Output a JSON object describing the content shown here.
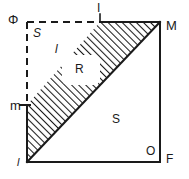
{
  "figure": {
    "stroke_color": "#1a1a1a",
    "hatch_color": "#1a1a1a",
    "background_color": "#ffffff",
    "labels": {
      "phi": "Φ",
      "upper_s": "S",
      "upper_l": "l",
      "top_i": "I",
      "corner_m_upper": "M",
      "left_m_lower": "m",
      "bottom_left_l": "l",
      "region_r": "R",
      "lower_s": "S",
      "inner_o": "O",
      "corner_f": "F"
    },
    "geometry": {
      "square": {
        "left": 27,
        "top": 22,
        "right": 160,
        "bottom": 162
      },
      "diagonal_from": [
        27,
        162
      ],
      "diagonal_to": [
        160,
        22
      ],
      "band_apex_top": [
        100,
        22
      ],
      "band_left_on_edge": [
        27,
        105
      ],
      "dashed_top_from": [
        27,
        22
      ],
      "dashed_top_to": [
        100,
        22
      ],
      "dashed_left_from": [
        27,
        22
      ],
      "dashed_left_to": [
        27,
        105
      ],
      "r_box": {
        "x": 62,
        "y": 55,
        "w": 38,
        "h": 30
      }
    }
  }
}
